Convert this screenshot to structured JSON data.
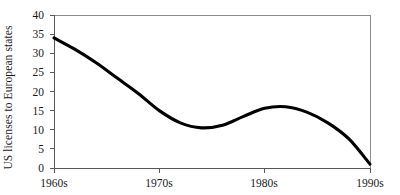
{
  "chart_data": {
    "type": "line",
    "title": "",
    "subtitle": "",
    "xlabel": "",
    "ylabel": "US licenses to European states",
    "x_tick_labels": [
      "1960s",
      "1970s",
      "1980s",
      "1990s"
    ],
    "y_tick_labels": [
      "0",
      "5",
      "10",
      "15",
      "20",
      "25",
      "30",
      "35",
      "40"
    ],
    "y_ticks": [
      0,
      5,
      10,
      15,
      20,
      25,
      30,
      35,
      40
    ],
    "ylim": [
      0,
      40
    ],
    "xlim": [
      1960,
      1990
    ],
    "grid": false,
    "legend": null,
    "legend_position": "none",
    "annotations": [],
    "series": [
      {
        "name": "US licenses to European states",
        "color": "#000000",
        "line_width": 3,
        "x": [
          1960,
          1962,
          1964,
          1966,
          1968,
          1970,
          1972,
          1974,
          1976,
          1978,
          1980,
          1982,
          1984,
          1986,
          1988,
          1990
        ],
        "values": [
          34.0,
          31.0,
          27.5,
          23.5,
          19.5,
          15.0,
          11.8,
          10.5,
          11.2,
          13.5,
          15.6,
          16.0,
          14.6,
          11.8,
          7.6,
          1.0
        ]
      }
    ],
    "key_points": {
      "start_1960s": 34,
      "local_minimum": 10.5,
      "local_minimum_x": "just after 1970s",
      "local_maximum": 16,
      "local_maximum_x": "just before 1980s",
      "end_1990s": 1
    },
    "colors": {
      "line": "#000000",
      "axis": "#58585a",
      "frame": "#8b8b8d",
      "text": "#1a1a1a",
      "background": "#ffffff"
    }
  }
}
